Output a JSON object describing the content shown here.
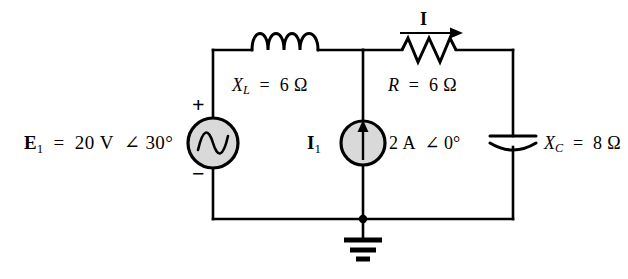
{
  "diagram": {
    "background_color": "#ffffff",
    "wire_color": "#000000",
    "source_fill_color": "#d9d9d9"
  },
  "labels": {
    "voltage_source": {
      "symbol": "E",
      "subscript": "1",
      "equals": "=",
      "value": "20 V",
      "angle_symbol": "∠",
      "phase": "30°",
      "full_text": "E₁ = 20 V ∠ 30°",
      "plus_sign": "+",
      "minus_sign": "−"
    },
    "inductor": {
      "symbol": "X",
      "subscript": "L",
      "equals": "=",
      "value": "6",
      "unit": "Ω",
      "full_text": "Xₗ = 6 Ω"
    },
    "resistor": {
      "symbol": "R",
      "equals": "=",
      "value": "6",
      "unit": "Ω",
      "full_text": "R = 6 Ω"
    },
    "capacitor": {
      "symbol": "X",
      "subscript": "C",
      "equals": "=",
      "value": "8",
      "unit": "Ω",
      "full_text": "Xᴄ = 8 Ω"
    },
    "current_source": {
      "symbol": "I",
      "subscript": "1",
      "value": "2 A",
      "angle_symbol": "∠",
      "phase": "0°",
      "full_text": "I₁  2 A ∠ 0°"
    },
    "branch_current": {
      "symbol": "I",
      "full_text": "I"
    }
  },
  "components": [
    {
      "name": "voltage-source-E1",
      "type": "ac-voltage-source",
      "value": "20 V ∠ 30°"
    },
    {
      "name": "inductor-XL",
      "type": "inductor",
      "value": "6 Ω"
    },
    {
      "name": "resistor-R",
      "type": "resistor",
      "value": "6 Ω"
    },
    {
      "name": "current-source-I1",
      "type": "ac-current-source",
      "value": "2 A ∠ 0°"
    },
    {
      "name": "capacitor-XC",
      "type": "capacitor",
      "value": "8 Ω"
    },
    {
      "name": "ground",
      "type": "ground",
      "value": ""
    }
  ]
}
